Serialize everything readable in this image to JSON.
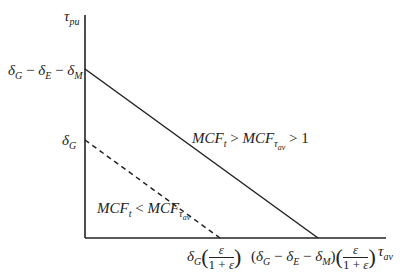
{
  "diagram": {
    "y_axis": {
      "label": "τ",
      "label_sub": "pu"
    },
    "x_axis": {
      "label": "τ",
      "label_sub": "av"
    },
    "y_ticks": [
      {
        "id": "upper",
        "main": "δ",
        "parts": [
          [
            "δ",
            "G"
          ],
          [
            "δ",
            "E"
          ],
          [
            "δ",
            "M"
          ]
        ],
        "text": "δG − δE − δM"
      },
      {
        "id": "lower",
        "text": "δG"
      }
    ],
    "x_ticks": [
      {
        "id": "left",
        "text": "δG(ε/(1+ε))",
        "frac_num": "ε",
        "frac_den_a": "1 + ",
        "frac_den_b": "ε"
      },
      {
        "id": "right",
        "text": "(δG − δE − δM)(ε/(1+ε))",
        "frac_num": "ε",
        "frac_den_a": "1 + ",
        "frac_den_b": "ε"
      }
    ],
    "lines": [
      {
        "id": "solid",
        "style": "solid",
        "label": "MCFt > MCFτav > 1",
        "x1": 85,
        "y1": 69,
        "x2": 318,
        "y2": 238
      },
      {
        "id": "dashed",
        "style": "dashed",
        "label": "MCFt < MCFτav",
        "x1": 85,
        "y1": 140,
        "x2": 220,
        "y2": 238
      }
    ],
    "labels": {
      "solid": {
        "a": "MCF",
        "a_sub": "t",
        "op1": " > ",
        "b": "MCF",
        "b_sub": "τ",
        "b_subsub": "av",
        "op2": " > ",
        "c": "1"
      },
      "dashed": {
        "a": "MCF",
        "a_sub": "t",
        "op1": " < ",
        "b": "MCF",
        "b_sub": "τ",
        "b_subsub": "av"
      }
    },
    "symbols": {
      "delta": "δ",
      "minus": " − ",
      "G": "G",
      "E": "E",
      "M": "M",
      "lparen": "(",
      "rparen": ")"
    },
    "colors": {
      "line": "#222222",
      "background": "#ffffff"
    }
  }
}
